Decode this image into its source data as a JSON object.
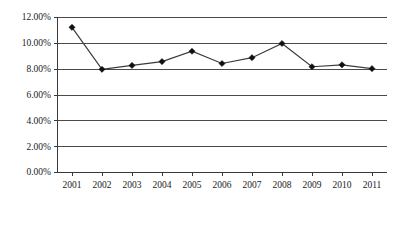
{
  "chart_data": {
    "type": "line",
    "title": "",
    "subtitle": "",
    "xlabel": "",
    "ylabel": "",
    "categories": [
      "2001",
      "2002",
      "2003",
      "2004",
      "2005",
      "2006",
      "2007",
      "2008",
      "2009",
      "2010",
      "2011"
    ],
    "values": [
      11.2,
      7.95,
      8.25,
      8.55,
      9.35,
      8.4,
      8.85,
      9.95,
      8.15,
      8.3,
      8.0
    ],
    "value_labels": [
      "11.20%",
      "7.95%",
      "8.25%",
      "8.55%",
      "9.35%",
      "8.40%",
      "8.85%",
      "9.95%",
      "8.15%",
      "8.30%",
      "8.00%"
    ],
    "ylim": [
      0,
      12
    ],
    "ytick_values": [
      0,
      2,
      4,
      6,
      8,
      10,
      12
    ],
    "ytick_labels": [
      "0.00%",
      "2.00%",
      "4.00%",
      "6.00%",
      "8.00%",
      "10.00%",
      "12.00%"
    ],
    "grid": true,
    "grid_orientation": "horizontal",
    "legend": false,
    "legend_position": "none",
    "marker": "diamond",
    "line_color": "#3c3c3c",
    "marker_color": "#101010",
    "grid_color": "#4a4a4a",
    "background_color": "#ffffff"
  },
  "plot_geometry": {
    "left": 57,
    "right": 387,
    "top": 17,
    "bottom": 172
  }
}
